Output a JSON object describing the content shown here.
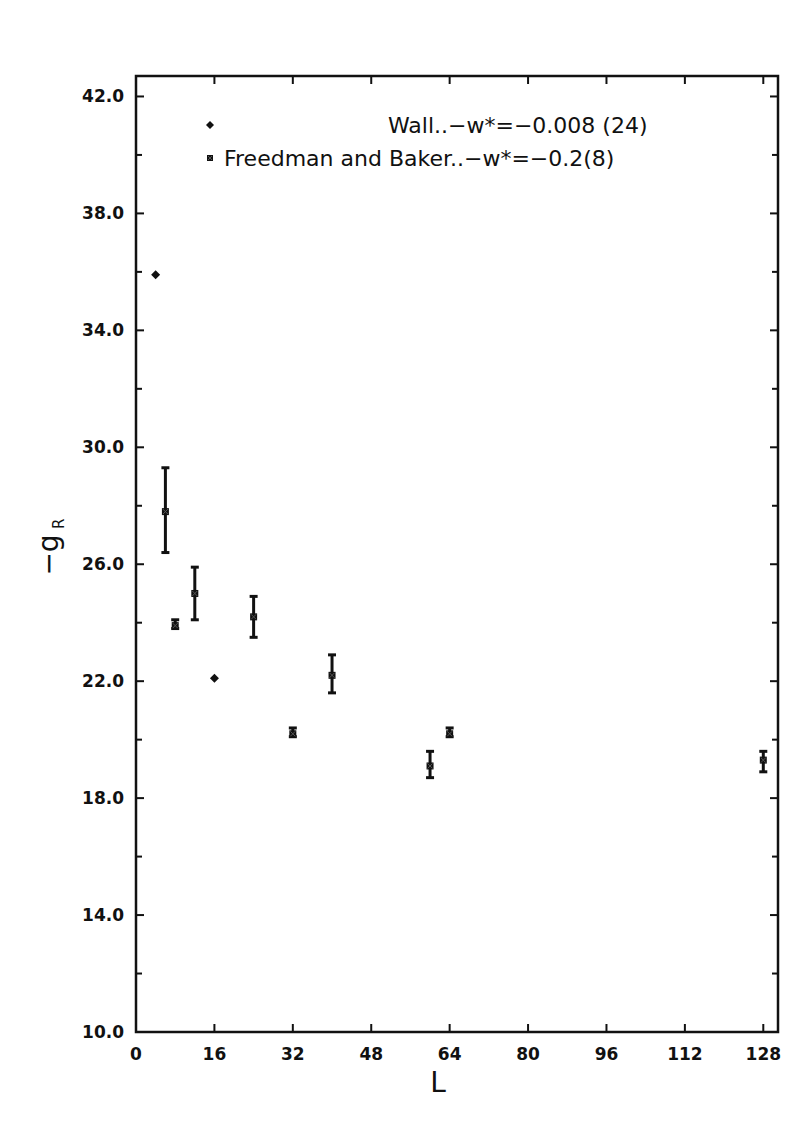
{
  "chart_data": {
    "type": "scatter",
    "title": "",
    "xlabel": "L",
    "ylabel": "−g_R",
    "xlim": [
      0,
      131
    ],
    "ylim": [
      10.0,
      42.7
    ],
    "xticks": [
      0,
      16,
      32,
      48,
      64,
      80,
      96,
      112,
      128
    ],
    "xtick_labels": [
      "0",
      "16",
      "32",
      "48",
      "64",
      "80",
      "96",
      "112",
      "128"
    ],
    "yticks": [
      10,
      14,
      18,
      22,
      26,
      30,
      34,
      38,
      42
    ],
    "ytick_labels": [
      "10.0",
      "14.0",
      "18.0",
      "22.0",
      "26.0",
      "30.0",
      "34.0",
      "38.0",
      "42.0"
    ],
    "yminor_ticks": [
      12,
      16,
      20,
      24,
      28,
      32,
      36,
      40
    ],
    "grid": false,
    "legend_position": "upper right (inside)",
    "series": [
      {
        "name": "Wall..−w*=−0.008 (24)",
        "marker": "diamond",
        "points": [
          {
            "x": 4,
            "y": 35.9
          },
          {
            "x": 16,
            "y": 22.1
          }
        ]
      },
      {
        "name": "Freedman and Baker..−w*=−0.2(8)",
        "marker": "x-box",
        "points": [
          {
            "x": 6,
            "y": 27.8,
            "ylow": 26.4,
            "yhigh": 29.3
          },
          {
            "x": 8,
            "y": 23.9,
            "ylow": 23.8,
            "yhigh": 24.1
          },
          {
            "x": 12,
            "y": 25.0,
            "ylow": 24.1,
            "yhigh": 25.9
          },
          {
            "x": 24,
            "y": 24.2,
            "ylow": 23.5,
            "yhigh": 24.9
          },
          {
            "x": 32,
            "y": 20.2,
            "ylow": 20.1,
            "yhigh": 20.4
          },
          {
            "x": 40,
            "y": 22.2,
            "ylow": 21.6,
            "yhigh": 22.9
          },
          {
            "x": 60,
            "y": 19.1,
            "ylow": 18.7,
            "yhigh": 19.6
          },
          {
            "x": 64,
            "y": 20.2,
            "ylow": 20.1,
            "yhigh": 20.4
          },
          {
            "x": 128,
            "y": 19.3,
            "ylow": 18.9,
            "yhigh": 19.6
          }
        ]
      }
    ]
  },
  "legend": {
    "entries": [
      {
        "marker": "diamond",
        "label": "Wall..−w*=−0.008 (24)"
      },
      {
        "marker": "x-box",
        "label": "Freedman and Baker..−w*=−0.2(8)"
      }
    ]
  },
  "axes": {
    "x_title": "L",
    "y_title_main": "−g",
    "y_title_sub": "R"
  }
}
